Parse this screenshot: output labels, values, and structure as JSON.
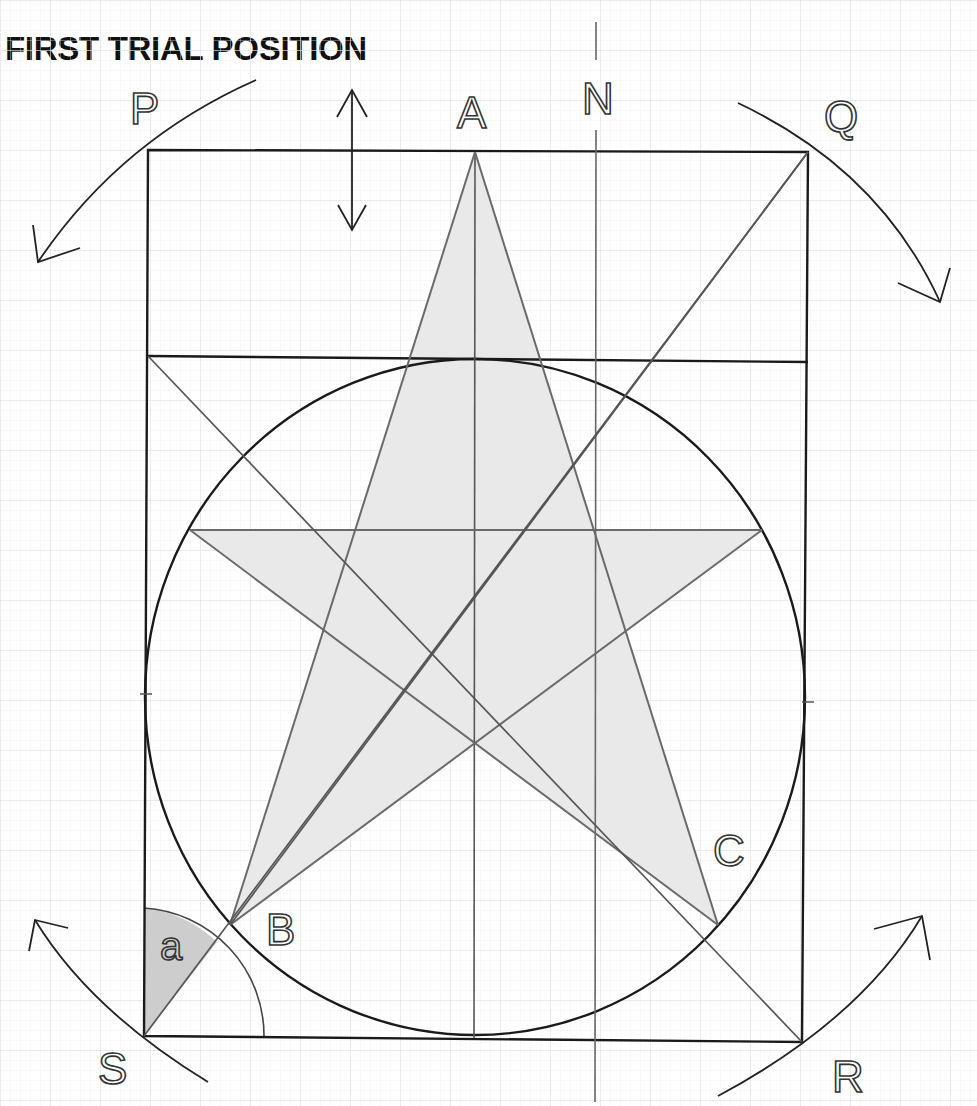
{
  "title": "FIRST TRIAL POSITION",
  "labels": {
    "A": "A",
    "N": "N",
    "P": "P",
    "Q": "Q",
    "R": "R",
    "S": "S",
    "B": "B",
    "C": "C",
    "angle": "a"
  },
  "colors": {
    "grid": "#e6e6e6",
    "grid_major": "#d8d8d8",
    "frame": "#1a1a1a",
    "construction": "#666666",
    "star_fill": "#ebebeb",
    "angle_fill": "#cfcfcf",
    "background": "#ffffff"
  },
  "geometry": {
    "rectangle": {
      "left": 148,
      "top": 150,
      "right": 808,
      "bottom": 1040
    },
    "inner_line_y": 358,
    "circle": {
      "cx": 475,
      "cy": 697,
      "r": 330
    },
    "star_points": {
      "A": [
        475,
        152
      ],
      "left": [
        190,
        530
      ],
      "right": [
        762,
        530
      ],
      "B": [
        230,
        925
      ],
      "C": [
        718,
        925
      ]
    },
    "north_line_x": 596
  }
}
